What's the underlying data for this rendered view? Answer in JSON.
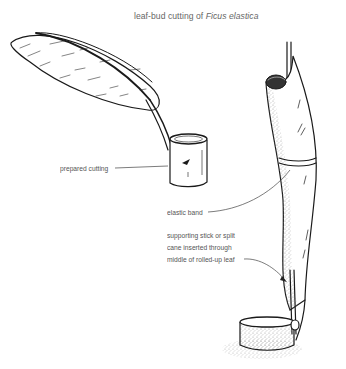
{
  "title": {
    "prefix": "leaf-bud cutting of ",
    "species": "Ficus elastica"
  },
  "labels": {
    "prepared_cutting": "prepared cutting",
    "elastic_band": "elastic band",
    "support_line1": "supporting stick or split",
    "support_line2": "cane inserted through",
    "support_line3": "middle of rolled-up leaf"
  },
  "colors": {
    "ink": "#1a1a1a",
    "label_text": "#555555",
    "leader_line": "#444444",
    "stipple": "#9a9a9a"
  }
}
